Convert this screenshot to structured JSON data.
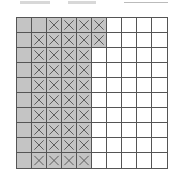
{
  "grid": {
    "rows": 10,
    "cols": 10,
    "colors": {
      "shaded": "#c4c4c4",
      "empty": "#ffffff",
      "line": "#555555",
      "cross": "#555555"
    },
    "cells": [
      [
        "S",
        "S",
        "SX",
        "SX",
        "SX",
        "SX",
        "E",
        "E",
        "E",
        "E"
      ],
      [
        "S",
        "SX",
        "SX",
        "SX",
        "SX",
        "SX",
        "E",
        "E",
        "E",
        "E"
      ],
      [
        "S",
        "SX",
        "SX",
        "SX",
        "SX",
        "E",
        "E",
        "E",
        "E",
        "E"
      ],
      [
        "S",
        "SX",
        "SX",
        "SX",
        "SX",
        "E",
        "E",
        "E",
        "E",
        "E"
      ],
      [
        "S",
        "SX",
        "SX",
        "SX",
        "SX",
        "E",
        "E",
        "E",
        "E",
        "E"
      ],
      [
        "S",
        "SX",
        "SX",
        "SX",
        "SX",
        "E",
        "E",
        "E",
        "E",
        "E"
      ],
      [
        "S",
        "SX",
        "SX",
        "SX",
        "SX",
        "E",
        "E",
        "E",
        "E",
        "E"
      ],
      [
        "S",
        "SX",
        "SX",
        "SX",
        "SX",
        "E",
        "E",
        "E",
        "E",
        "E"
      ],
      [
        "S",
        "SX",
        "SX",
        "SX",
        "SX",
        "E",
        "E",
        "E",
        "E",
        "E"
      ],
      [
        "S",
        "SX",
        "SX",
        "SX",
        "SX",
        "E",
        "E",
        "E",
        "E",
        "E"
      ]
    ],
    "legend": {
      "S": "shaded",
      "SX": "shaded-crossed",
      "E": "empty"
    }
  }
}
